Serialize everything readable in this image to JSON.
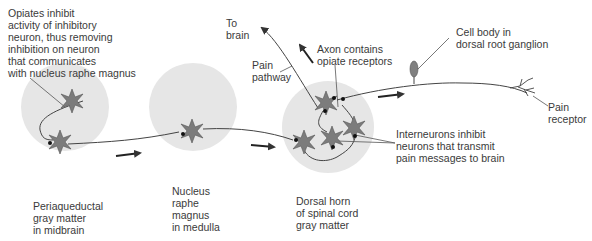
{
  "colors": {
    "background": "#ffffff",
    "region_fill": "#e6e6e6",
    "neuron_fill": "#7c7c7c",
    "neuron_stroke": "#555555",
    "axon": "#444444",
    "text": "#3a3a3a",
    "cell_body_fill": "#808080"
  },
  "labels": {
    "opiates_note": "Opiates inhibit\nactivity of inhibitory\nneuron, thus removing\ninhibition on neuron\nthat communicates\nwith nucleus raphe magnus",
    "to_brain": "To\nbrain",
    "pain_pathway": "Pain\npathway",
    "axon_opiate": "Axon contains\nopiate receptors",
    "cell_body": "Cell body in\ndorsal root ganglion",
    "pain_receptor": "Pain\nreceptor",
    "interneurons": "Interneurons inhibit\nneurons that transmit\npain messages to brain",
    "periaqueductal": "Periaqueductal\ngray matter\nin midbrain",
    "raphe": "Nucleus\nraphe\nmagnus\nin medulla",
    "dorsal_horn": "Dorsal horn\nof spinal cord\ngray matter"
  },
  "regions": [
    {
      "name": "periaqueductal-gray",
      "cx": 65,
      "cy": 107,
      "r": 44
    },
    {
      "name": "nucleus-raphe-magnus",
      "cx": 193,
      "cy": 107,
      "r": 44
    },
    {
      "name": "dorsal-horn",
      "cx": 328,
      "cy": 127,
      "r": 46
    }
  ]
}
